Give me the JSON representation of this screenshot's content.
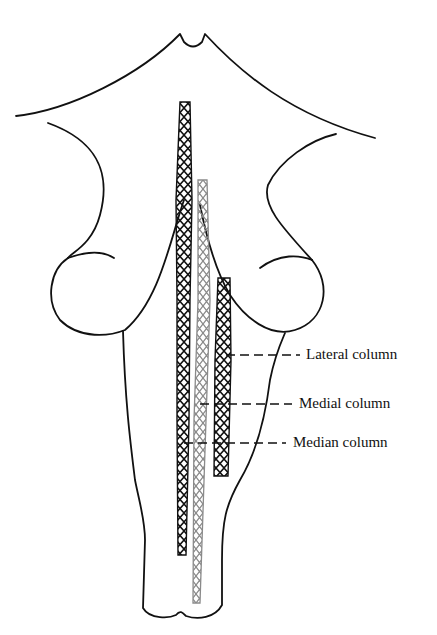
{
  "figure": {
    "type": "brainstem dorsal view schematic",
    "colors": {
      "outline": "#111111",
      "median_column": "#111111",
      "medial_column": "#8a8a8a",
      "lateral_column": "#111111",
      "background": "#ffffff"
    },
    "labels": [
      {
        "id": "lateral",
        "text": "Lateral column",
        "x": 306,
        "y": 347
      },
      {
        "id": "medial",
        "text": "Medial column",
        "x": 299,
        "y": 396
      },
      {
        "id": "median",
        "text": "Median column",
        "x": 293,
        "y": 433
      }
    ]
  }
}
